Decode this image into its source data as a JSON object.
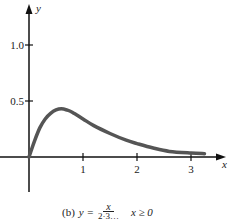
{
  "chart_data": {
    "type": "line",
    "title": "",
    "caption": {
      "label": "(b)",
      "lhs": "y =",
      "numerator": "x",
      "denominator": "2·3…",
      "condition": "x ≥ 0"
    },
    "xlabel": "x",
    "ylabel": "y",
    "x_ticks": [
      "1",
      "2",
      "3"
    ],
    "y_ticks": [
      "0.5",
      "1.0"
    ],
    "xlim": [
      0,
      3.4
    ],
    "ylim": [
      0,
      1.25
    ],
    "grid": false,
    "series": [
      {
        "name": "y",
        "color": "#555555",
        "x": [
          0,
          0.1,
          0.2,
          0.3,
          0.4,
          0.5,
          0.6,
          0.7,
          0.8,
          1.0,
          1.2,
          1.5,
          1.8,
          2.0,
          2.3,
          2.6,
          3.0,
          3.25
        ],
        "y": [
          0,
          0.14,
          0.26,
          0.34,
          0.39,
          0.42,
          0.43,
          0.42,
          0.4,
          0.34,
          0.28,
          0.21,
          0.15,
          0.12,
          0.08,
          0.05,
          0.035,
          0.03
        ]
      }
    ]
  }
}
